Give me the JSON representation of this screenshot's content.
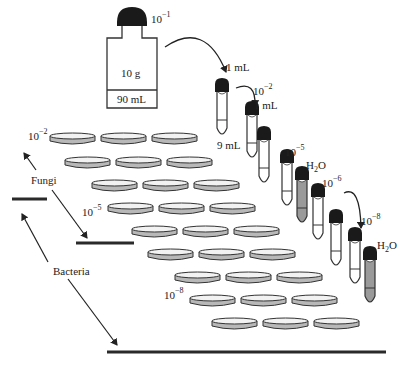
{
  "diagram": {
    "bottle": {
      "dilution_label": "10",
      "dilution_exp": "−1",
      "sample_label": "10 g",
      "volume_label": "90 mL"
    },
    "transfers": [
      {
        "label": "1 mL"
      },
      {
        "label": "1 mL"
      }
    ],
    "tube_labels": {
      "first_dilution": {
        "base": "10",
        "exp": "−2"
      },
      "diluent_volume": "9 mL",
      "fifth_dilution": {
        "base": "10",
        "exp": "−5"
      },
      "water_1": {
        "base": "H",
        "sub": "2",
        "tail": "O"
      },
      "sixth_dilution": {
        "base": "10",
        "exp": "−6"
      },
      "eighth_dilution": {
        "base": "10",
        "exp": "−8"
      },
      "water_2": {
        "base": "H",
        "sub": "2",
        "tail": "O"
      }
    },
    "tubes": [
      {
        "id": 1,
        "fill": "white"
      },
      {
        "id": 2,
        "fill": "white"
      },
      {
        "id": 3,
        "fill": "white"
      },
      {
        "id": 4,
        "fill": "white"
      },
      {
        "id": 5,
        "fill": "gray",
        "content": "H2O"
      },
      {
        "id": 6,
        "fill": "white"
      },
      {
        "id": 7,
        "fill": "white"
      },
      {
        "id": 8,
        "fill": "white"
      },
      {
        "id": 9,
        "fill": "gray",
        "content": "H2O"
      }
    ],
    "plate_rows": [
      {
        "row": 1,
        "label": {
          "base": "10",
          "exp": "−2"
        },
        "plates": 3
      },
      {
        "row": 2,
        "plates": 3
      },
      {
        "row": 3,
        "plates": 3
      },
      {
        "row": 4,
        "label": {
          "base": "10",
          "exp": "−5"
        },
        "plates": 3
      },
      {
        "row": 5,
        "plates": 3
      },
      {
        "row": 6,
        "plates": 3
      },
      {
        "row": 7,
        "plates": 3
      },
      {
        "row": 8,
        "label": {
          "base": "10",
          "exp": "−8"
        },
        "plates": 3
      },
      {
        "row": 9,
        "plates": 3
      }
    ],
    "groups": [
      {
        "label": "Fungi",
        "range": "10−2 to 10−5"
      },
      {
        "label": "Bacteria",
        "range": "10−5 to 10−8"
      }
    ],
    "colors": {
      "cap": "#1a1a1a",
      "outline": "#333333",
      "plate_side": "#b8b8b8",
      "plate_top": "#f2f2f2",
      "water_fill": "#9a9a9a",
      "bar": "#2a2a2a"
    }
  }
}
